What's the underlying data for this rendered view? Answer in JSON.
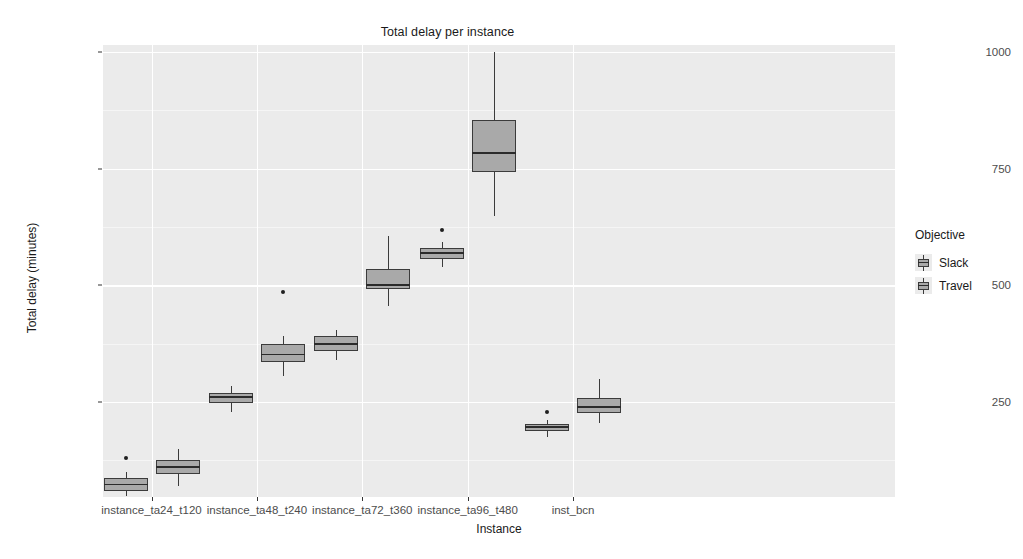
{
  "chart_data": {
    "type": "box",
    "title": "Total delay per instance",
    "xlabel": "Instance",
    "ylabel": "Total delay (minutes)",
    "grid": true,
    "legend_position": "right",
    "legend_title": "Objective",
    "ylim": [
      0,
      1030
    ],
    "yticks": [
      250,
      500,
      750,
      1000
    ],
    "ytick_labels": [
      "250",
      "500",
      "750",
      "1000"
    ],
    "categories": [
      "instance_ta24_t120",
      "instance_ta48_t240",
      "instance_ta72_t360",
      "instance_ta96_t480",
      "inst_bcn"
    ],
    "series": [
      {
        "name": "Slack",
        "color": "#a9a9a9",
        "boxes": [
          {
            "category": "instance_ta24_t120",
            "lower_whisker": 48,
            "q1": 60,
            "median": 73,
            "q3": 87,
            "upper_whisker": 100,
            "outliers": [
              130
            ]
          },
          {
            "category": "instance_ta48_t240",
            "lower_whisker": 228,
            "q1": 247,
            "median": 260,
            "q3": 270,
            "upper_whisker": 285,
            "outliers": []
          },
          {
            "category": "instance_ta72_t360",
            "lower_whisker": 340,
            "q1": 360,
            "median": 375,
            "q3": 392,
            "upper_whisker": 405,
            "outliers": []
          },
          {
            "category": "instance_ta96_t480",
            "lower_whisker": 540,
            "q1": 556,
            "median": 570,
            "q3": 580,
            "upper_whisker": 592,
            "outliers": [
              618
            ]
          },
          {
            "category": "inst_bcn",
            "lower_whisker": 175,
            "q1": 188,
            "median": 196,
            "q3": 203,
            "upper_whisker": 212,
            "outliers": [
              228
            ]
          }
        ]
      },
      {
        "name": "Travel",
        "color": "#a9a9a9",
        "boxes": [
          {
            "category": "instance_ta24_t120",
            "lower_whisker": 70,
            "q1": 95,
            "median": 110,
            "q3": 125,
            "upper_whisker": 150,
            "outliers": []
          },
          {
            "category": "instance_ta48_t240",
            "lower_whisker": 305,
            "q1": 335,
            "median": 352,
            "q3": 375,
            "upper_whisker": 392,
            "outliers": [
              485
            ]
          },
          {
            "category": "instance_ta72_t360",
            "lower_whisker": 455,
            "q1": 492,
            "median": 500,
            "q3": 536,
            "upper_whisker": 605,
            "outliers": []
          },
          {
            "category": "instance_ta96_t480",
            "lower_whisker": 648,
            "q1": 742,
            "median": 783,
            "q3": 855,
            "upper_whisker": 1000,
            "outliers": []
          },
          {
            "category": "inst_bcn",
            "lower_whisker": 205,
            "q1": 226,
            "median": 240,
            "q3": 258,
            "upper_whisker": 300,
            "outliers": []
          }
        ]
      }
    ]
  },
  "axes": {
    "y_title": "Total delay (minutes)",
    "x_title": "Instance",
    "y_tick_labels": [
      "1000",
      "750",
      "500",
      "250"
    ],
    "x_tick_labels": [
      "instance_ta24_t120",
      "instance_ta48_t240",
      "instance_ta72_t360",
      "instance_ta96_t480",
      "inst_bcn"
    ]
  },
  "legend": {
    "title": "Objective",
    "items": [
      {
        "label": "Slack"
      },
      {
        "label": "Travel"
      }
    ]
  },
  "theme": {
    "panel_bg": "#ebebeb",
    "grid_color": "#ffffff",
    "box_fill": "#a9a9a9",
    "box_line": "#3b3b3b",
    "text_color": "#1a1a1a",
    "tick_text_color": "#4d4d4d"
  }
}
